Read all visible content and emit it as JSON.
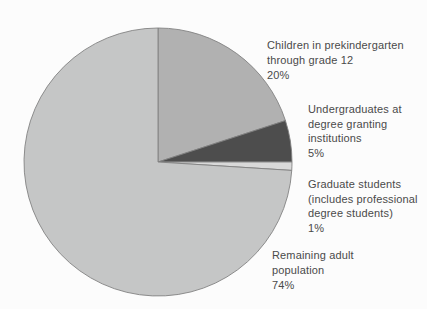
{
  "figure": {
    "background_color": "#fcfcfc",
    "text_color": "#4a4a4a",
    "outline_color": "#828282"
  },
  "chart_data": {
    "type": "pie",
    "start_angle_deg": -90,
    "direction": "clockwise",
    "legend": "none",
    "labels_position": "right",
    "slices": [
      {
        "id": "children-prek-grade12",
        "label": "Children in prekindergarten through grade 12",
        "lines": [
          "Children in prekindergarten",
          "through grade 12"
        ],
        "value": 20,
        "pct": "20%",
        "color": "#b1b1b1"
      },
      {
        "id": "undergraduates",
        "label": "Undergraduates at degree granting institutions",
        "lines": [
          "Undergraduates at",
          "degree granting",
          "institutions"
        ],
        "value": 5,
        "pct": "5%",
        "color": "#4d4d4d"
      },
      {
        "id": "graduate-students",
        "label": "Graduate students (includes professional degree students)",
        "lines": [
          "Graduate students",
          "(includes professional",
          "degree students)"
        ],
        "value": 1,
        "pct": "1%",
        "color": "#d9d9d9"
      },
      {
        "id": "remaining-adult-population",
        "label": "Remaining adult population",
        "lines": [
          "Remaining adult",
          "population"
        ],
        "value": 74,
        "pct": "74%",
        "color": "#c5c6c6"
      }
    ]
  }
}
